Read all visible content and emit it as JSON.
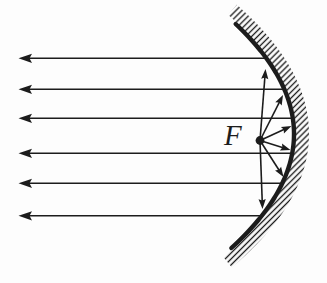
{
  "figure": {
    "type": "ray-diagram-concave-parabolic-mirror",
    "focus_label": "F"
  },
  "colors": {
    "ink": "#1c1c1c",
    "background": "#fdfdfd"
  },
  "canvas": {
    "width": 327,
    "height": 283
  },
  "mirror": {
    "vertex_x": 294,
    "center_y": 134,
    "coeff": 0.00482,
    "y_top": 24,
    "y_bottom": 248,
    "stroke_width": 4.4,
    "hatch": {
      "inner_offset": 1.8,
      "outer_offset": 15,
      "spacing": 4.2,
      "stroke_width": 1.35,
      "angle_deg": 45,
      "extend": 8
    }
  },
  "focus": {
    "x": 260,
    "y": 140.5,
    "radius": 4.4,
    "label_left": 224,
    "label_top": 121,
    "font_size": 29
  },
  "parallel_rays": {
    "tip_x": 18.5,
    "line_start_x": 29,
    "y_values": [
      58.3,
      89.3,
      118.3,
      153.3,
      183.3,
      215.8
    ],
    "arrow": {
      "length": 13.5,
      "half_width": 4.6,
      "notch": 11
    }
  },
  "focal_rays": {
    "tips": [
      [
        265.5,
        69
      ],
      [
        283.0,
        95
      ],
      [
        291.5,
        126
      ],
      [
        290.5,
        150
      ],
      [
        283.5,
        177
      ],
      [
        262.5,
        209
      ]
    ],
    "arrow": {
      "length": 10,
      "half_width": 3.6,
      "notch": 8.5
    }
  },
  "line_width": 1.6
}
